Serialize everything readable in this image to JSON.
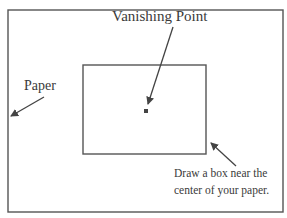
{
  "diagram": {
    "labels": {
      "vanishing_point": "Vanishing Point",
      "paper": "Paper",
      "instruction_line1": "Draw a box near the",
      "instruction_line2": "center of your paper."
    },
    "elements": {
      "paper_outline": {
        "x": 8,
        "y": 10,
        "width": 275,
        "height": 202
      },
      "inner_box": {
        "x": 83,
        "y": 65,
        "width": 123,
        "height": 89
      },
      "vanishing_point_marker": {
        "x": 144,
        "y": 109,
        "size": 4
      }
    },
    "arrows": [
      {
        "name": "vanishing-point-arrow",
        "from": [
          173,
          27
        ],
        "to": [
          148,
          104
        ]
      },
      {
        "name": "paper-arrow",
        "from": [
          44,
          97
        ],
        "to": [
          11,
          116
        ]
      },
      {
        "name": "box-arrow",
        "from": [
          236,
          166
        ],
        "to": [
          211,
          143
        ]
      }
    ],
    "colors": {
      "line": "#555555",
      "text": "#3a3a3a",
      "background": "#ffffff"
    }
  }
}
